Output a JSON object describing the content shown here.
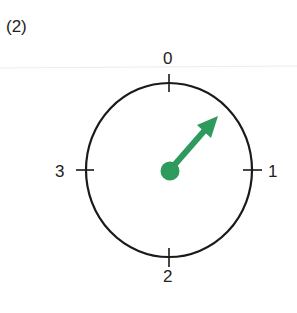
{
  "figure": {
    "label": "(2)"
  },
  "dial": {
    "positions": [
      "0",
      "1",
      "2",
      "3"
    ],
    "pointer_direction": "between 0 and 1",
    "pointer_color": "#2e9a5e",
    "outline_color": "#1a1a1a"
  }
}
